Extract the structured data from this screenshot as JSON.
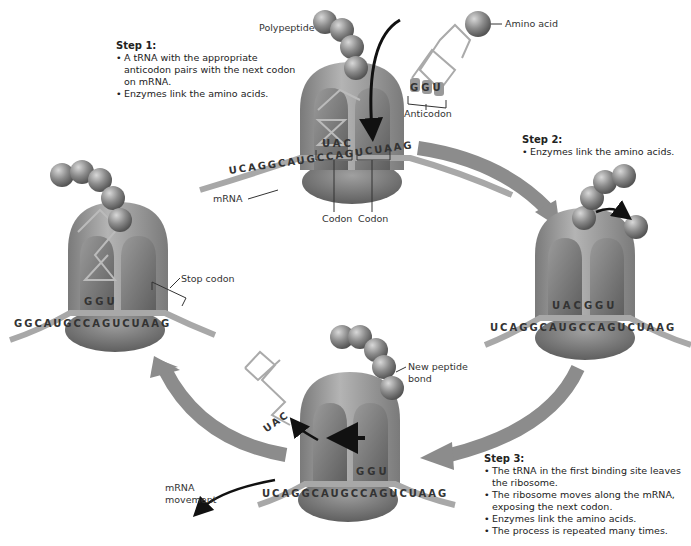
{
  "steps": {
    "step1": {
      "title": "Step 1:",
      "bullets": [
        "A tRNA with the appropriate anticodon pairs with the next codon on mRNA.",
        "Enzymes link the amino acids."
      ]
    },
    "step2": {
      "title": "Step 2:",
      "bullets": [
        "Enzymes link the amino acids."
      ]
    },
    "step3": {
      "title": "Step 3:",
      "bullets": [
        "The tRNA in the first binding site leaves the ribosome.",
        "The ribosome moves along the mRNA, exposing the next codon.",
        "Enzymes link the amino acids.",
        "The process is repeated many times."
      ]
    }
  },
  "labels": {
    "polypeptide": "Polypeptide",
    "amino_acid": "Amino acid",
    "anticodon": "Anticodon",
    "mrna": "mRNA",
    "codon1": "Codon",
    "codon2": "Codon",
    "stop_codon": "Stop codon",
    "new_peptide_bond_l1": "New peptide",
    "new_peptide_bond_l2": "bond",
    "mrna_movement_l1": "mRNA",
    "mrna_movement_l2": "movement"
  },
  "sequences": {
    "top_mrna": "UCAGGCAUGCCAGUCUAAG",
    "top_trna_anticodon": "UAC",
    "incoming_anticodon": "GGU",
    "right_mrna": "UCAGGCAUGCCAGUCUAAG",
    "right_anticodons": "UACGGU",
    "bottom_mrna": "UCAGGCAUGCCAGUCUAAG",
    "bottom_anticodon": "GGU",
    "leaving_anticodon": "UAC",
    "left_mrna": "GGCAUGCCAGUCUAAG",
    "left_anticodon": "GGU"
  },
  "colors": {
    "ribosome": "#9a9a9a",
    "ribosome_dark": "#6e6e6e",
    "amino_acid": "#8a8a8a",
    "cycle_arrow": "#8c8c8c",
    "mrna_strand": "#a8a8a8"
  }
}
